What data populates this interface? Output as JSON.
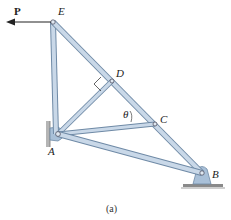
{
  "figure": {
    "caption": "(a)",
    "load_label": "P",
    "angle_label": "θ",
    "joints": [
      {
        "id": "E",
        "label": "E"
      },
      {
        "id": "D",
        "label": "D"
      },
      {
        "id": "C",
        "label": "C"
      },
      {
        "id": "A",
        "label": "A"
      },
      {
        "id": "B",
        "label": "B"
      }
    ],
    "members": [
      "AE",
      "EB",
      "AD",
      "AC",
      "AB"
    ],
    "supports": {
      "A": "pin (wall)",
      "B": "pin (ground)"
    },
    "colors": {
      "member_fill": "#c9d8e8",
      "member_edge": "#6f8aa6",
      "support_fill": "#a9c0d8",
      "ground": "#9a9a9a",
      "ink": "#222222"
    }
  }
}
